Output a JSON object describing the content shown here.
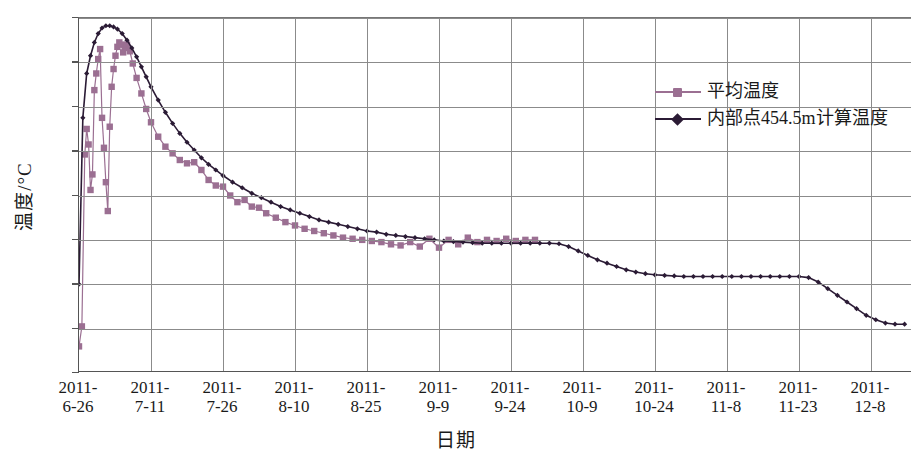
{
  "axes": {
    "y_title": "温度/°C",
    "x_title": "日期",
    "y_ticks": [
      "40",
      "36",
      "32",
      "28",
      "24",
      "20",
      "16",
      "12",
      "8"
    ],
    "x_ticks": [
      {
        "l1": "2011-",
        "l2": "6-26"
      },
      {
        "l1": "2011-",
        "l2": "7-11"
      },
      {
        "l1": "2011-",
        "l2": "7-26"
      },
      {
        "l1": "2011-",
        "l2": "8-10"
      },
      {
        "l1": "2011-",
        "l2": "8-25"
      },
      {
        "l1": "2011-",
        "l2": "9-9"
      },
      {
        "l1": "2011-",
        "l2": "9-24"
      },
      {
        "l1": "2011-",
        "l2": "10-9"
      },
      {
        "l1": "2011-",
        "l2": "10-24"
      },
      {
        "l1": "2011-",
        "l2": "11-8"
      },
      {
        "l1": "2011-",
        "l2": "11-23"
      },
      {
        "l1": "2011-",
        "l2": "12-8"
      }
    ]
  },
  "legend": {
    "items": [
      {
        "label": "平均温度",
        "color": "#9b6f92",
        "marker": "square"
      },
      {
        "label": "内部点454.5m计算温度",
        "color": "#2b1b35",
        "marker": "diamond"
      }
    ]
  },
  "colors": {
    "series_measured": "#9b6f92",
    "series_calculated": "#2b1b35",
    "grid": "#8b8b8b",
    "axis": "#555555",
    "background": "#ffffff"
  },
  "chart_data": {
    "type": "line",
    "title": "",
    "xlabel": "日期",
    "ylabel": "温度/°C",
    "ylim": [
      8,
      40
    ],
    "grid": true,
    "legend_position": "top-right",
    "x_tick_labels": [
      "2011-6-26",
      "2011-7-11",
      "2011-7-26",
      "2011-8-10",
      "2011-8-25",
      "2011-9-9",
      "2011-9-24",
      "2011-10-9",
      "2011-10-24",
      "2011-11-8",
      "2011-11-23",
      "2011-12-8"
    ],
    "x_tick_days": [
      0,
      15,
      30,
      45,
      60,
      75,
      90,
      105,
      120,
      135,
      150,
      165
    ],
    "y_ticks": [
      40,
      36,
      32,
      28,
      24,
      20,
      16,
      12,
      8
    ],
    "x_unit": "days since 2011-6-26",
    "series": [
      {
        "name": "平均温度",
        "color": "#9b6f92",
        "marker": "square",
        "x": [
          0,
          0.6,
          1.2,
          1.6,
          2.0,
          2.4,
          2.8,
          3.2,
          3.6,
          4.0,
          4.4,
          4.8,
          5.2,
          5.6,
          6.0,
          6.4,
          6.8,
          7.2,
          7.6,
          8.0,
          8.4,
          8.8,
          9.2,
          9.6,
          10.0,
          10.6,
          11.2,
          12.0,
          13.0,
          14.0,
          15.0,
          16.5,
          18.0,
          19.5,
          21.0,
          22.5,
          24.0,
          25.5,
          27.0,
          28.5,
          30.0,
          31.5,
          33.0,
          34.5,
          36.0,
          37.5,
          39.0,
          41.0,
          43.0,
          45.0,
          47.0,
          49.0,
          51.0,
          53.0,
          55.0,
          57.0,
          59.0,
          61.0,
          63.0,
          65.0,
          67.0,
          69.0,
          71.0,
          73.0,
          75.0,
          77.0,
          79.0,
          81.0,
          83.0,
          85.0,
          87.0,
          89.0,
          91.0,
          93.0,
          95.0
        ],
        "y": [
          10.4,
          12.2,
          27.7,
          30.0,
          28.6,
          24.5,
          25.9,
          33.5,
          35.0,
          36.3,
          37.2,
          31.0,
          28.3,
          25.2,
          22.6,
          30.2,
          33.8,
          35.4,
          36.6,
          37.4,
          37.8,
          37.6,
          36.9,
          37.3,
          37.6,
          37.0,
          35.9,
          34.6,
          33.2,
          31.8,
          30.6,
          29.3,
          28.4,
          27.8,
          27.2,
          26.9,
          27.0,
          26.3,
          25.4,
          24.9,
          24.8,
          24.0,
          23.4,
          23.6,
          23.0,
          22.9,
          22.4,
          22.0,
          21.6,
          21.3,
          21.0,
          20.8,
          20.6,
          20.4,
          20.2,
          20.1,
          20.0,
          19.9,
          19.8,
          19.6,
          19.5,
          19.8,
          19.4,
          20.1,
          19.3,
          20.0,
          19.6,
          20.2,
          19.8,
          20.0,
          19.9,
          20.1,
          19.9,
          20.0,
          20.0
        ]
      },
      {
        "name": "内部点454.5m计算温度",
        "color": "#2b1b35",
        "marker": "diamond",
        "x": [
          0,
          0.8,
          1.6,
          2.4,
          3.2,
          4.0,
          4.8,
          5.6,
          6.4,
          7.2,
          8.0,
          9.0,
          10.0,
          11.0,
          12.0,
          13.0,
          14.0,
          15.0,
          16.5,
          18.0,
          19.5,
          21.0,
          22.5,
          24.0,
          25.5,
          27.0,
          28.5,
          30.0,
          32.0,
          34.0,
          36.0,
          38.0,
          40.0,
          42.0,
          44.0,
          46.0,
          48.0,
          50.0,
          52.0,
          54.0,
          56.0,
          58.0,
          60.0,
          62.0,
          64.0,
          66.0,
          68.0,
          70.0,
          72.0,
          74.0,
          76.0,
          78.0,
          80.0,
          82.0,
          84.0,
          86.0,
          88.0,
          90.0,
          92.0,
          94.0,
          96.0,
          98.0,
          100.0,
          102.0,
          104.0,
          106.0,
          108.0,
          110.0,
          112.0,
          114.0,
          116.0,
          118.0,
          120.0,
          122.0,
          124.0,
          126.0,
          128.0,
          130.0,
          132.0,
          134.0,
          136.0,
          138.0,
          140.0,
          142.0,
          144.0,
          146.0,
          148.0,
          150.0,
          152.0,
          154.0,
          156.0,
          158.0,
          160.0,
          162.0,
          164.0,
          166.0,
          168.0,
          170.0,
          172.0
        ],
        "y": [
          16.0,
          31.0,
          35.0,
          36.6,
          37.8,
          38.6,
          39.1,
          39.3,
          39.3,
          39.2,
          39.0,
          38.6,
          38.0,
          37.3,
          36.5,
          35.6,
          34.7,
          33.8,
          32.6,
          31.5,
          30.5,
          29.6,
          28.8,
          28.1,
          27.4,
          26.8,
          26.3,
          25.8,
          25.2,
          24.7,
          24.2,
          23.8,
          23.4,
          23.0,
          22.7,
          22.4,
          22.1,
          21.8,
          21.6,
          21.4,
          21.2,
          21.0,
          20.8,
          20.7,
          20.5,
          20.4,
          20.3,
          20.2,
          20.1,
          20.0,
          19.9,
          19.85,
          19.8,
          19.75,
          19.7,
          19.7,
          19.7,
          19.7,
          19.7,
          19.7,
          19.7,
          19.7,
          19.65,
          19.4,
          19.0,
          18.6,
          18.2,
          17.9,
          17.6,
          17.3,
          17.1,
          16.95,
          16.85,
          16.8,
          16.75,
          16.7,
          16.7,
          16.7,
          16.7,
          16.7,
          16.7,
          16.7,
          16.7,
          16.7,
          16.7,
          16.7,
          16.7,
          16.7,
          16.6,
          16.2,
          15.6,
          15.0,
          14.4,
          13.8,
          13.2,
          12.8,
          12.5,
          12.4,
          12.4
        ]
      }
    ]
  }
}
